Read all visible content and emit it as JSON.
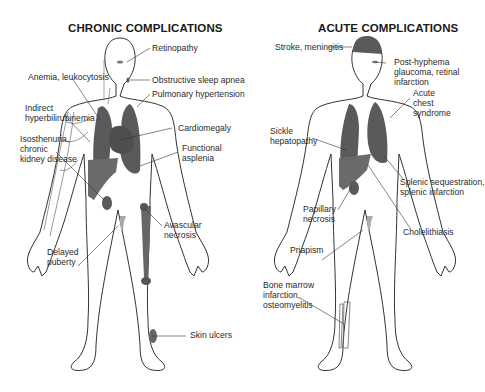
{
  "panels": [
    {
      "title": "CHRONIC COMPLICATIONS",
      "labels": [
        "Retinopathy",
        "Obstructive sleep apnea",
        "Anemia, leukocytosis",
        "Pulmonary hypertension",
        "Indirect\nhyperbilirubinemia",
        "Cardiomegaly",
        "Isosthenuria,\nchronic\nkidney disease",
        "Functional\nasplenia",
        "Avascular\nnecrosis",
        "Delayed\npuberty",
        "Skin ulcers"
      ]
    },
    {
      "title": "ACUTE COMPLICATIONS",
      "labels": [
        "Stroke, meningitis",
        "Post-hyphema\nglaucoma, retinal\ninfarction",
        "Acute\nchest\nsyndrome",
        "Sickle\nhepatopathy",
        "Splenic sequestration,\nsplenic infarction",
        "Papillary\nnecrosis",
        "Cholelithiasis",
        "Priapism",
        "Bone marrow\ninfarction,\nosteomyelitis"
      ]
    }
  ],
  "colors": {
    "organ": "#5a5a5a",
    "organ_light": "#9a9a9a",
    "outline": "#333333",
    "text": "#2a2a2a"
  }
}
